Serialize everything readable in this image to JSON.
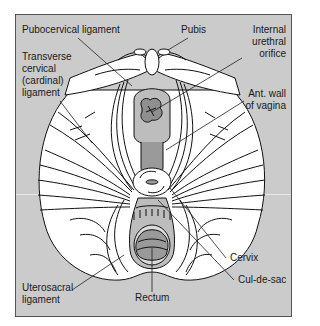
{
  "figure": {
    "colors": {
      "background": "#cbcbcb",
      "tissue": "#ffffff",
      "lumen": "#9a9a9a",
      "lumen_light": "#b8b8b8",
      "outline": "#111111"
    }
  },
  "labels": {
    "pubocervical": "Pubocervical ligament",
    "pubis": "Pubis",
    "urethral_1": "Internal",
    "urethral_2": "urethral",
    "urethral_3": "orifice",
    "transverse_1": "Transverse",
    "transverse_2": "cervical",
    "transverse_3": "(cardinal)",
    "transverse_4": "ligament",
    "antwall_1": "Ant. wall",
    "antwall_2": "of vagina",
    "cervix": "Cervix",
    "culdesac": "Cul-de-sac",
    "uterosacral_1": "Uterosacral",
    "uterosacral_2": "ligament",
    "rectum": "Rectum"
  }
}
